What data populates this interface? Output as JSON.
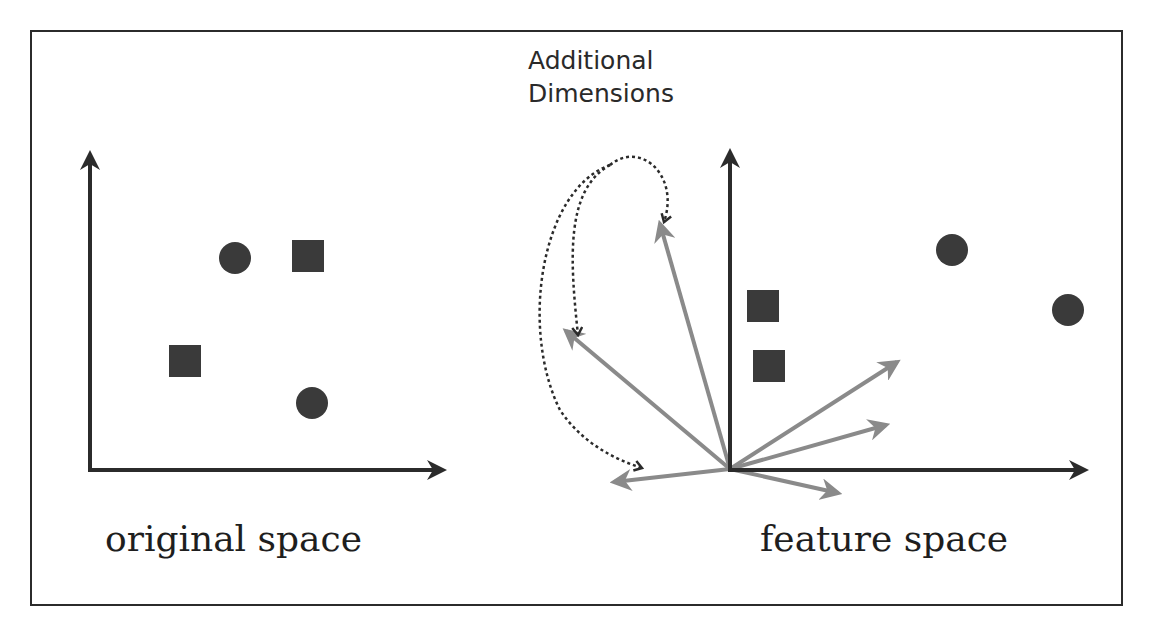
{
  "figure": {
    "title_lines": [
      "Additional",
      "Dimensions"
    ],
    "panels": {
      "left": {
        "label": "original space"
      },
      "right": {
        "label": "feature space"
      }
    }
  },
  "colors": {
    "frame": "#2b2b2b",
    "axis": "#2b2b2b",
    "marker": "#3a3a3a",
    "vector": "#8a8a8a",
    "dotted_curve": "#2b2b2b",
    "background": "#ffffff"
  },
  "left_panel": {
    "axes": {
      "origin": [
        90,
        470
      ],
      "x_end": [
        445,
        470
      ],
      "y_end": [
        90,
        152
      ]
    },
    "markers": [
      {
        "shape": "circle",
        "cx": 235,
        "cy": 258,
        "r": 16
      },
      {
        "shape": "square",
        "x": 292,
        "y": 240,
        "size": 32
      },
      {
        "shape": "square",
        "x": 169,
        "y": 345,
        "size": 32
      },
      {
        "shape": "circle",
        "cx": 312,
        "cy": 403,
        "r": 16
      }
    ]
  },
  "right_panel": {
    "axes": {
      "origin": [
        730,
        470
      ],
      "x_end": [
        1087,
        470
      ],
      "y_end": [
        730,
        150
      ]
    },
    "markers": [
      {
        "shape": "circle",
        "cx": 952,
        "cy": 250,
        "r": 16
      },
      {
        "shape": "circle",
        "cx": 1068,
        "cy": 310,
        "r": 16
      },
      {
        "shape": "square",
        "x": 747,
        "y": 290,
        "size": 32
      },
      {
        "shape": "square",
        "x": 753,
        "y": 350,
        "size": 32
      }
    ],
    "vectors": [
      {
        "to": [
          660,
          224
        ]
      },
      {
        "to": [
          566,
          331
        ]
      },
      {
        "to": [
          614,
          482
        ]
      },
      {
        "to": [
          897,
          362
        ]
      },
      {
        "to": [
          886,
          425
        ]
      },
      {
        "to": [
          838,
          493
        ]
      }
    ],
    "dotted_arrows": [
      {
        "path": "M 610 165 C 565 190, 570 260, 578 335"
      },
      {
        "path": "M 610 165 C 640 140, 680 175, 664 222"
      },
      {
        "path": "M 610 165 C 540 190, 520 330, 560 410 C 580 440, 610 458, 642 468"
      }
    ]
  }
}
